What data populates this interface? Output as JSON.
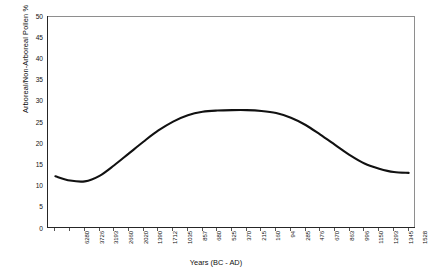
{
  "chart_data": {
    "type": "line",
    "title": "",
    "xlabel": "Years (BC - AD)",
    "ylabel": "Arboreal/Non-Arboreal Pollen %",
    "ylim": [
      0,
      50
    ],
    "yticks": [
      50,
      45,
      40,
      35,
      30,
      25,
      20,
      15,
      10,
      5,
      0
    ],
    "grid": false,
    "legend": "none",
    "line_color": "#111111",
    "categories": [
      "6280",
      "3726",
      "3193",
      "2660",
      "2020",
      "1390",
      "1712",
      "1035",
      "857",
      "680",
      "525",
      "370",
      "215",
      "160",
      "94",
      "285",
      "476",
      "670",
      "863",
      "996",
      "1150",
      "1293",
      "1345",
      "1528",
      "1660"
    ],
    "values": [
      12.2,
      11.2,
      11.0,
      12.3,
      14.8,
      17.6,
      20.4,
      23.0,
      25.1,
      26.6,
      27.4,
      27.7,
      27.8,
      27.8,
      27.6,
      27.1,
      26.0,
      24.3,
      22.0,
      19.6,
      17.2,
      15.2,
      14.0,
      13.2,
      13.0
    ],
    "series": [
      {
        "name": "Arboreal/Non-Arboreal Pollen %",
        "values": [
          12.2,
          11.2,
          11.0,
          12.3,
          14.8,
          17.6,
          20.4,
          23.0,
          25.1,
          26.6,
          27.4,
          27.7,
          27.8,
          27.8,
          27.6,
          27.1,
          26.0,
          24.3,
          22.0,
          19.6,
          17.2,
          15.2,
          14.0,
          13.2,
          13.0
        ]
      }
    ]
  }
}
